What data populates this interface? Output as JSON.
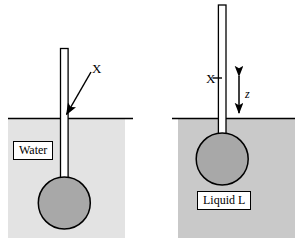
{
  "figure": {
    "width": 303,
    "height": 244,
    "background_color": "#ffffff"
  },
  "panels": [
    {
      "id": "left",
      "liquid_label": "Water",
      "liquid_fill_color": "#e3e3e3",
      "bulb_fill_color": "#a8a8a8",
      "tube_fill_color": "#ffffff",
      "surface_line_color": "#000000",
      "marking_label": "X",
      "marking_note": "arrow points to tube at liquid surface",
      "liquid_rect": {
        "x": 8,
        "y": 118,
        "w": 117,
        "h": 120
      },
      "surface_line": {
        "x1": 8,
        "x2": 133,
        "y": 118
      },
      "tube": {
        "x": 60,
        "y": 48,
        "w": 8,
        "h": 134
      },
      "bulb": {
        "cx": 64,
        "cy": 203,
        "r": 26
      },
      "arrow": {
        "x1": 91,
        "y1": 72,
        "x2": 65,
        "y2": 115
      }
    },
    {
      "id": "right",
      "liquid_label": "Liquid L",
      "liquid_fill_color": "#c9c9c9",
      "bulb_fill_color": "#a8a8a8",
      "tube_fill_color": "#ffffff",
      "surface_line_color": "#000000",
      "marking_label": "X",
      "marking_note": "tick mark on tube above liquid surface",
      "distance_label": "z",
      "distance_note": "double headed arrow from mark X down to liquid surface",
      "liquid_rect": {
        "x": 178,
        "y": 118,
        "w": 117,
        "h": 120
      },
      "surface_line": {
        "x1": 172,
        "x2": 295,
        "y": 118
      },
      "tube": {
        "x": 218,
        "y": 5,
        "w": 8,
        "h": 133
      },
      "bulb": {
        "cx": 222,
        "cy": 159,
        "r": 26
      },
      "tick": {
        "x1": 213,
        "y1": 78,
        "x2": 222,
        "y2": 78
      },
      "z_arrow": {
        "x": 239,
        "y_top": 72,
        "y_bottom": 117
      }
    }
  ],
  "colors": {
    "stroke": "#000000",
    "water_fill": "#e3e3e3",
    "liquid_l_fill": "#c9c9c9",
    "bulb_fill": "#a8a8a8",
    "tube_fill": "#ffffff",
    "page_background": "#ffffff"
  }
}
